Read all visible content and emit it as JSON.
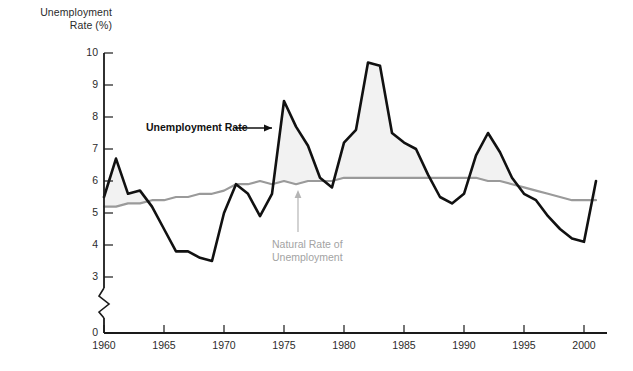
{
  "figure": {
    "y_axis_title_line1": "Unemployment",
    "y_axis_title_line2": "Rate (%)",
    "annotation_unemployment": "Unemployment Rate",
    "annotation_natural_line1": "Natural Rate of",
    "annotation_natural_line2": "Unemployment",
    "colors": {
      "unemployment_line": "#111111",
      "natural_rate_line": "#9a9a9a",
      "gap_fill": "#f2f2f2",
      "axis": "#1a1a1a",
      "text": "#2b2b2b",
      "gray_text": "#a3a3a3"
    }
  },
  "chart_data": {
    "type": "line",
    "title": "",
    "xlabel": "",
    "ylabel": "Unemployment Rate (%)",
    "xlim": [
      1960,
      2001.5
    ],
    "ylim": [
      0,
      10
    ],
    "axis_break": true,
    "axis_break_between": [
      0,
      3
    ],
    "grid": false,
    "legend": "inline-annotations",
    "ytick_labels": [
      "0",
      "3",
      "4",
      "5",
      "6",
      "7",
      "8",
      "9",
      "10"
    ],
    "ytick_values": [
      0,
      3,
      4,
      5,
      6,
      7,
      8,
      9,
      10
    ],
    "xtick_labels": [
      "1960",
      "1965",
      "1970",
      "1975",
      "1980",
      "1985",
      "1990",
      "1995",
      "2000"
    ],
    "xtick_values": [
      1960,
      1965,
      1970,
      1975,
      1980,
      1985,
      1990,
      1995,
      2000
    ],
    "x": [
      1960,
      1961,
      1962,
      1963,
      1964,
      1965,
      1966,
      1967,
      1968,
      1969,
      1970,
      1971,
      1972,
      1973,
      1974,
      1975,
      1976,
      1977,
      1978,
      1979,
      1980,
      1981,
      1982,
      1983,
      1984,
      1985,
      1986,
      1987,
      1988,
      1989,
      1990,
      1991,
      1992,
      1993,
      1994,
      1995,
      1996,
      1997,
      1998,
      1999,
      2000,
      2001
    ],
    "series": [
      {
        "name": "Unemployment Rate",
        "color": "#111111",
        "values": [
          5.5,
          6.7,
          5.6,
          5.7,
          5.2,
          4.5,
          3.8,
          3.8,
          3.6,
          3.5,
          5.0,
          5.9,
          5.6,
          4.9,
          5.6,
          8.5,
          7.7,
          7.1,
          6.1,
          5.8,
          7.2,
          7.6,
          9.7,
          9.6,
          7.5,
          7.2,
          7.0,
          6.2,
          5.5,
          5.3,
          5.6,
          6.8,
          7.5,
          6.9,
          6.1,
          5.6,
          5.4,
          4.9,
          4.5,
          4.2,
          4.1,
          6.0
        ]
      },
      {
        "name": "Natural Rate of Unemployment",
        "color": "#9a9a9a",
        "values": [
          5.2,
          5.2,
          5.3,
          5.3,
          5.4,
          5.4,
          5.5,
          5.5,
          5.6,
          5.6,
          5.7,
          5.9,
          5.9,
          6.0,
          5.9,
          6.0,
          5.9,
          6.0,
          6.0,
          6.0,
          6.1,
          6.1,
          6.1,
          6.1,
          6.1,
          6.1,
          6.1,
          6.1,
          6.1,
          6.1,
          6.1,
          6.1,
          6.0,
          6.0,
          5.9,
          5.8,
          5.7,
          5.6,
          5.5,
          5.4,
          5.4,
          5.4
        ]
      }
    ]
  }
}
